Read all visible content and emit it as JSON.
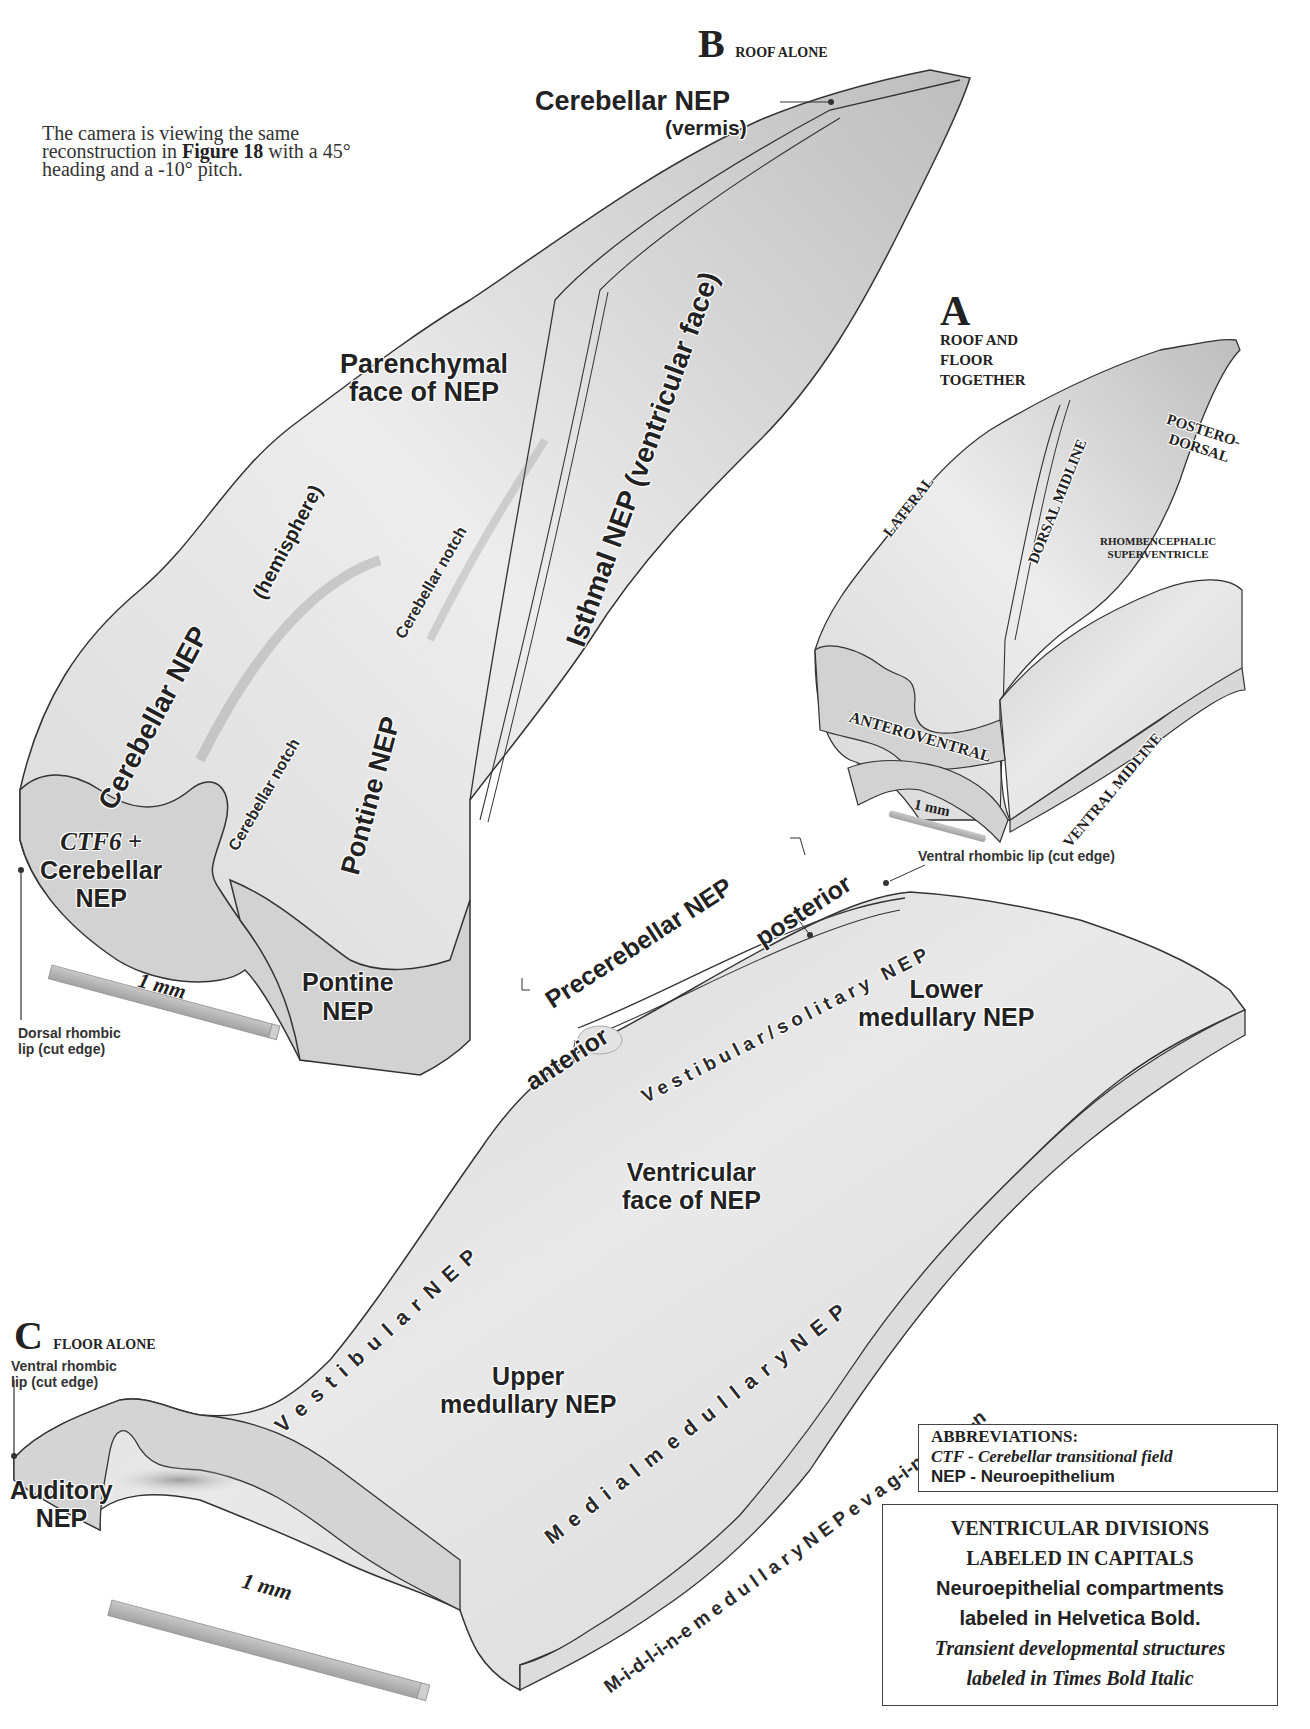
{
  "intro_text": {
    "line1": "The camera is viewing the same",
    "line2_pre": "reconstruction in ",
    "line2_bold": "Figure 18",
    "line2_post": " with a 45°",
    "line3": "heading and a -10° pitch."
  },
  "panel_b": {
    "letter": "B",
    "title": "ROOF ALONE",
    "labels": {
      "cerebellar_nep_vermis_1": "Cerebellar NEP",
      "cerebellar_nep_vermis_2": "(vermis)",
      "parenchymal_1": "Parenchymal",
      "parenchymal_2": "face of NEP",
      "isthmal": "Isthmal NEP (ventricular face)",
      "cerebellar_nep_hemi": "Cerebellar NEP",
      "hemisphere": "(hemisphere)",
      "cerebellar_notch_upper": "Cerebellar notch",
      "cerebellar_notch_lower": "Cerebellar notch",
      "pontine_nep_rotated": "Pontine NEP",
      "ctf6": "CTF6 +",
      "ctf6_cerebellar": "Cerebellar",
      "ctf6_nep": "NEP",
      "pontine_section_1": "Pontine",
      "pontine_section_2": "NEP",
      "scale": "1 mm",
      "dorsal_lip_1": "Dorsal rhombic",
      "dorsal_lip_2": "lip (cut edge)"
    }
  },
  "panel_a": {
    "letter": "A",
    "title_lines": [
      "ROOF AND",
      "FLOOR",
      "TOGETHER"
    ],
    "labels": {
      "lateral": "LATERAL",
      "dorsal_midline": "DORSAL MIDLINE",
      "postero_1": "POSTERO-",
      "postero_2": "DORSAL",
      "superventricle_1": "RHOMBENCEPHALIC",
      "superventricle_2": "SUPERVENTRICLE",
      "anteroventral": "ANTEROVENTRAL",
      "ventral_midline": "VENTRAL MIDLINE",
      "scale": "1 mm"
    }
  },
  "panel_c": {
    "letter": "C",
    "title": "FLOOR ALONE",
    "labels": {
      "ventral_lip_top": "Ventral rhombic lip (cut edge)",
      "precerebellar": "Precerebellar NEP",
      "posterior": "posterior",
      "anterior": "anterior",
      "vestibular_solitary": "Vestibular/solitary NEP",
      "lower_1": "Lower",
      "lower_2": "medullary NEP",
      "ventricular_1": "Ventricular",
      "ventricular_2": "face of NEP",
      "vestibular_nep": "V e s t i b u l a r   N E P",
      "medial_medullary": "M e d i a l   m e d u l l a r y   N E P",
      "midline_evag": "M-i-d-l-i-n-e  m e d u l l a r y  N E P  e v a g-i-n-a-t-i-o-n",
      "upper_1": "Upper",
      "upper_2": "medullary NEP",
      "ventral_lip_left_1": "Ventral rhombic",
      "ventral_lip_left_2": "lip (cut edge)",
      "auditory_1": "Auditory",
      "auditory_2": "NEP",
      "scale": "1 mm"
    }
  },
  "abbreviations": {
    "title": "ABBREVIATIONS:",
    "ctf": "CTF - Cerebellar transitional field",
    "nep": "NEP - Neuroepithelium"
  },
  "legend": {
    "line1": "VENTRICULAR DIVISIONS",
    "line2": "LABELED IN CAPITALS",
    "line3": "Neuroepithelial compartments",
    "line4": "labeled in Helvetica Bold.",
    "line5": "Transient developmental structures",
    "line6": "labeled in Times Bold Italic"
  },
  "colors": {
    "tissue_light": "#e6e6e6",
    "tissue_mid": "#cfcfcf",
    "tissue_dark": "#9a9a9a",
    "section_fill": "#d4d4d4",
    "outline": "#333333",
    "scale_bar": "#b5b5b5"
  }
}
